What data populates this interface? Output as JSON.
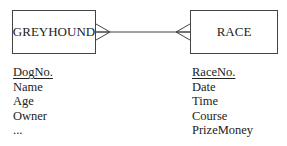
{
  "diagram": {
    "type": "entity-relationship",
    "entities": [
      {
        "name": "GREYHOUND",
        "primary_key": "DogNo.",
        "attributes": [
          "Name",
          "Age",
          "Owner",
          "..."
        ]
      },
      {
        "name": "RACE",
        "primary_key": "RaceNo.",
        "attributes": [
          "Date",
          "Time",
          "Course",
          "PrizeMoney",
          "..."
        ]
      }
    ],
    "relationships": [
      {
        "from": "GREYHOUND",
        "to": "RACE",
        "cardinality": "many-to-many",
        "notation": "crow's foot"
      }
    ],
    "colors": {
      "line": "#444444",
      "text": "#222222",
      "background": "#ffffff"
    }
  }
}
